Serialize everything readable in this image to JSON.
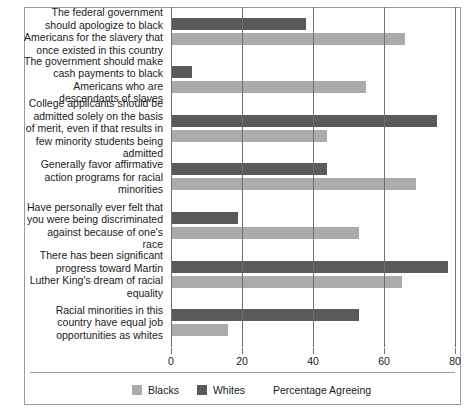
{
  "chart_data": {
    "type": "bar",
    "orientation": "horizontal",
    "title": "",
    "xlabel": "Percentage Agreeing",
    "ylabel": "",
    "xlim": [
      0,
      80
    ],
    "xticks": [
      0,
      20,
      40,
      60,
      80
    ],
    "xtick_labels": [
      "0",
      "20",
      "40",
      "60",
      "80"
    ],
    "grid": true,
    "legend_position": "bottom",
    "categories": [
      "The federal government should apologize to black Americans for the slavery that once existed in this country",
      "The government should make cash payments to black Americans who are descendants of slaves",
      "College applicants should be admitted solely on the basis of merit, even if that results in few minority students being admitted",
      "Generally favor affirmative action programs for racial minorities",
      "Have personally ever felt that you were being discriminated against because of one's race",
      "There has been significant progress toward Martin Luther King's dream of racial equality",
      "Racial minorities in this country have equal job opportunities as whites"
    ],
    "series": [
      {
        "name": "Whites",
        "color": "#5a5a5a",
        "values": [
          38,
          6,
          75,
          44,
          19,
          78,
          53
        ]
      },
      {
        "name": "Blacks",
        "color": "#ababab",
        "values": [
          66,
          55,
          44,
          69,
          53,
          65,
          16
        ]
      }
    ]
  },
  "legend": {
    "items": [
      {
        "label": "Blacks",
        "swatch": "blacks-swatch"
      },
      {
        "label": "Whites",
        "swatch": "whites-swatch"
      }
    ],
    "axis_title": "Percentage Agreeing"
  },
  "colors": {
    "whites_bar": "#5a5a5a",
    "blacks_bar": "#ababab",
    "grid": "#6f6f6f",
    "frame": "#9a9a9a",
    "background": "#ffffff"
  }
}
